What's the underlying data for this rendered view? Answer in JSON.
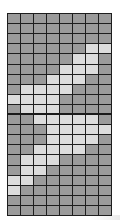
{
  "grid": {
    "rows": 20,
    "cols": 8,
    "colors": {
      "off": "#9b9b9b",
      "on": "#dcdcdc",
      "line": "#1e1e1e"
    },
    "on_cells": [
      [],
      [],
      [],
      [
        6,
        7
      ],
      [
        5,
        6
      ],
      [
        4,
        5,
        6
      ],
      [
        3,
        4,
        5
      ],
      [
        1,
        2,
        3,
        4
      ],
      [
        0,
        1,
        2,
        3
      ],
      [
        1,
        2,
        3
      ],
      [
        2,
        3,
        4,
        5,
        6
      ],
      [
        3,
        4,
        5,
        6,
        7
      ],
      [
        3,
        4,
        5,
        6
      ],
      [
        2,
        3,
        4,
        5
      ],
      [
        1,
        2,
        3
      ],
      [
        1,
        2
      ],
      [
        0,
        1
      ],
      [
        0
      ],
      [],
      []
    ]
  }
}
